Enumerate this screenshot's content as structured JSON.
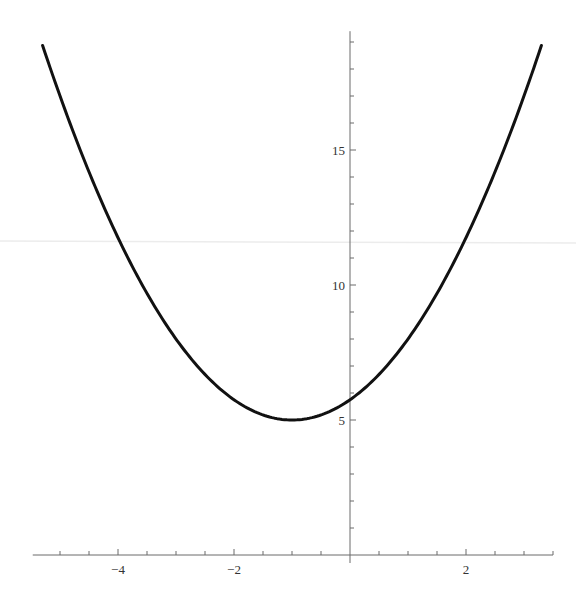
{
  "chart_data": {
    "type": "line",
    "title": "",
    "xlabel": "",
    "ylabel": "",
    "function": "y = 0.75*(x+1)^2 + 5",
    "series": [
      {
        "name": "parabola",
        "color": "#111111",
        "x_range": [
          -5.3,
          3.3
        ],
        "vertex": [
          -1,
          5
        ],
        "points": [
          [
            -5.3,
            18.87
          ],
          [
            -5.0,
            17.0
          ],
          [
            -4.5,
            14.19
          ],
          [
            -4.0,
            11.75
          ],
          [
            -3.5,
            9.69
          ],
          [
            -3.0,
            8.0
          ],
          [
            -2.5,
            6.69
          ],
          [
            -2.0,
            5.75
          ],
          [
            -1.5,
            5.19
          ],
          [
            -1.0,
            5.0
          ],
          [
            -0.5,
            5.19
          ],
          [
            0.0,
            5.75
          ],
          [
            0.5,
            6.69
          ],
          [
            1.0,
            8.0
          ],
          [
            1.5,
            9.69
          ],
          [
            2.0,
            11.75
          ],
          [
            2.5,
            14.19
          ],
          [
            3.0,
            17.0
          ],
          [
            3.3,
            18.87
          ]
        ]
      }
    ],
    "xlim": [
      -5.47,
      3.5
    ],
    "ylim": [
      0,
      19.4
    ],
    "x_ticks_major": [
      -4,
      -2,
      2
    ],
    "x_tick_labels": [
      "−4",
      "−2",
      "2"
    ],
    "x_ticks_minor_step": 0.5,
    "y_ticks_major": [
      5,
      10,
      15
    ],
    "y_tick_labels": [
      "5",
      "10",
      "15"
    ],
    "y_ticks_minor_step": 1,
    "grid": false,
    "legend": null,
    "axes_origin": [
      0,
      0
    ]
  }
}
